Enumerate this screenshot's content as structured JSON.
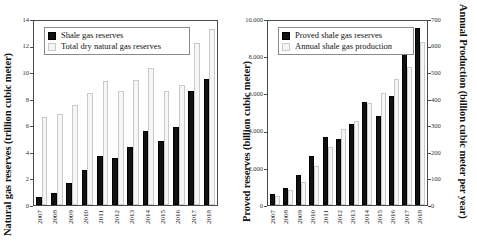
{
  "figure": {
    "panels": [
      {
        "id": "left-panel",
        "left_axis_title": "Natural gas reserves (trillion cubic meter)",
        "yticks_left": [
          "0",
          "2",
          "4",
          "6",
          "8",
          "10",
          "12",
          "14"
        ],
        "legend": [
          {
            "label": "Shale gas reserves",
            "swatch": "dark"
          },
          {
            "label": "Total dry natural gas reserves",
            "swatch": "light"
          }
        ]
      },
      {
        "id": "right-panel",
        "left_axis_title": "Proved reserves (billion cubic meter)",
        "right_axis_title": "Annual Production (billion cubic meter per year)",
        "yticks_left": [
          "0",
          "2.000",
          "4.000",
          "6.000",
          "8.000",
          "10.000"
        ],
        "yticks_right": [
          "0",
          "100",
          "200",
          "300",
          "400",
          "500",
          "600",
          "700"
        ],
        "legend": [
          {
            "label": "Proved shale gas reserves",
            "swatch": "dark"
          },
          {
            "label": "Annual shale gas production",
            "swatch": "light"
          }
        ]
      }
    ]
  },
  "chart_data": [
    {
      "type": "bar",
      "title": "",
      "xlabel": "",
      "ylabel": "Natural gas reserves (trillion cubic meter)",
      "ylim": [
        0,
        14
      ],
      "ytick_step": 2,
      "grid": false,
      "legend_position": "top-left",
      "categories": [
        "2007",
        "2008",
        "2009",
        "2010",
        "2011",
        "2012",
        "2013",
        "2014",
        "2015",
        "2016",
        "2017",
        "2018"
      ],
      "series": [
        {
          "name": "Shale gas reserves",
          "color": "#111111",
          "values": [
            0.6,
            0.9,
            1.65,
            2.65,
            3.7,
            3.6,
            4.4,
            5.6,
            4.9,
            5.9,
            8.65,
            9.6
          ]
        },
        {
          "name": "Total dry natural gas reserves",
          "color": "#f6f6f6",
          "values": [
            6.7,
            6.9,
            7.6,
            8.55,
            9.4,
            8.7,
            9.5,
            10.4,
            8.7,
            9.1,
            12.3,
            13.4
          ]
        }
      ]
    },
    {
      "type": "bar",
      "title": "",
      "xlabel": "",
      "ylabel": "Proved reserves (billion cubic meter)",
      "y2label": "Annual Production (billion cubic meter per year)",
      "ylim": [
        0,
        10000
      ],
      "ytick_step": 2000,
      "y2lim": [
        0,
        700
      ],
      "y2tick_step": 100,
      "grid": false,
      "legend_position": "top-left",
      "categories": [
        "2007",
        "2008",
        "2009",
        "2010",
        "2011",
        "2012",
        "2013",
        "2014",
        "2015",
        "2016",
        "2017",
        "2018"
      ],
      "series": [
        {
          "name": "Proved shale gas reserves",
          "axis": "left",
          "color": "#111111",
          "values": [
            600,
            900,
            1650,
            2650,
            3700,
            3600,
            4400,
            5600,
            4850,
            5900,
            8650,
            9600
          ]
        },
        {
          "name": "Annual shale gas production",
          "axis": "right",
          "color": "#f6f6f6",
          "values": [
            36,
            58,
            86,
            150,
            220,
            290,
            320,
            390,
            425,
            480,
            525,
            620
          ]
        }
      ]
    }
  ]
}
